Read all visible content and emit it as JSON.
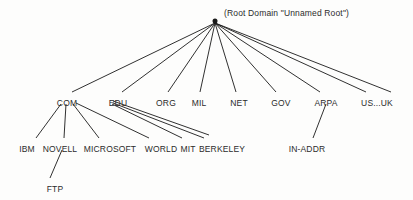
{
  "diagram": {
    "background_color": "#fdfdfc",
    "line_color": "#1a1a1a",
    "text_color": "#2b2b2b"
  },
  "root": {
    "caption": "(Root Domain \"Unnamed Root\")",
    "dot_name": "root-domain-dot",
    "x": 215,
    "y": 21,
    "caption_x": 224,
    "caption_y": 9
  },
  "levels": [
    {
      "name": "top-level-domains",
      "y": 99,
      "nodes": [
        {
          "label": "COM",
          "x": 67
        },
        {
          "label": "EDU",
          "x": 118
        },
        {
          "label": "ORG",
          "x": 166
        },
        {
          "label": "MIL",
          "x": 199
        },
        {
          "label": "NET",
          "x": 239
        },
        {
          "label": "GOV",
          "x": 281
        },
        {
          "label": "ARPA",
          "x": 326
        },
        {
          "label": "US...UK",
          "x": 377
        }
      ]
    },
    {
      "name": "second-level-domains",
      "y": 145,
      "nodes": [
        {
          "label": "IBM",
          "x": 27
        },
        {
          "label": "NOVELL",
          "x": 60
        },
        {
          "label": "MICROSOFT",
          "x": 110
        },
        {
          "label": "WORLD",
          "x": 161
        },
        {
          "label": "MIT",
          "x": 188
        },
        {
          "label": "BERKELEY",
          "x": 222
        },
        {
          "label": "IN-ADDR",
          "x": 307
        }
      ]
    },
    {
      "name": "third-level-domains",
      "y": 185,
      "nodes": [
        {
          "label": "FTP",
          "x": 55
        }
      ]
    }
  ],
  "edges": [
    {
      "name": "edge-root-to-com",
      "x1": 215,
      "y1": 23,
      "x2": 72,
      "y2": 92
    },
    {
      "name": "edge-root-to-edu",
      "x1": 215,
      "y1": 23,
      "x2": 122,
      "y2": 92
    },
    {
      "name": "edge-root-to-org",
      "x1": 215,
      "y1": 23,
      "x2": 168,
      "y2": 92
    },
    {
      "name": "edge-root-to-mil",
      "x1": 215,
      "y1": 23,
      "x2": 200,
      "y2": 92
    },
    {
      "name": "edge-root-to-net",
      "x1": 215,
      "y1": 23,
      "x2": 236,
      "y2": 92
    },
    {
      "name": "edge-root-to-gov",
      "x1": 215,
      "y1": 23,
      "x2": 276,
      "y2": 92
    },
    {
      "name": "edge-root-to-arpa",
      "x1": 215,
      "y1": 23,
      "x2": 320,
      "y2": 92
    },
    {
      "name": "edge-root-to-us-uk-a",
      "x1": 215,
      "y1": 23,
      "x2": 366,
      "y2": 92
    },
    {
      "name": "edge-root-to-us-uk-b",
      "x1": 215,
      "y1": 23,
      "x2": 391,
      "y2": 92
    },
    {
      "name": "edge-com-to-ibm",
      "x1": 61,
      "y1": 104,
      "x2": 36,
      "y2": 138
    },
    {
      "name": "edge-com-to-novell",
      "x1": 66,
      "y1": 104,
      "x2": 64,
      "y2": 138
    },
    {
      "name": "edge-com-to-microsoft",
      "x1": 73,
      "y1": 104,
      "x2": 99,
      "y2": 138
    },
    {
      "name": "edge-com-to-world",
      "x1": 76,
      "y1": 103,
      "x2": 149,
      "y2": 138
    },
    {
      "name": "edge-edu-to-mit",
      "x1": 112,
      "y1": 104,
      "x2": 182,
      "y2": 138
    },
    {
      "name": "edge-edu-to-berkeley",
      "x1": 113,
      "y1": 103,
      "x2": 204,
      "y2": 138
    },
    {
      "name": "edge-edu-to-berkeley-2",
      "x1": 113,
      "y1": 101,
      "x2": 209,
      "y2": 135
    },
    {
      "name": "edge-arpa-to-in-addr",
      "x1": 326,
      "y1": 104,
      "x2": 313,
      "y2": 138
    },
    {
      "name": "edge-novell-to-ftp",
      "x1": 62,
      "y1": 150,
      "x2": 50,
      "y2": 178
    }
  ]
}
